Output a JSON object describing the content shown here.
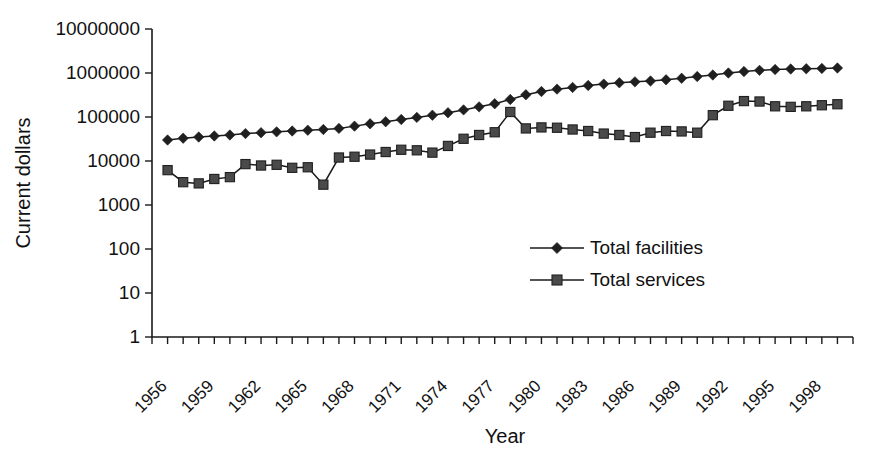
{
  "chart_data": {
    "type": "line",
    "title": "",
    "xlabel": "Year",
    "ylabel": "Current dollars",
    "yscale": "log",
    "ylim": [
      1,
      10000000
    ],
    "ytick_labels": [
      "10000000",
      "1000000",
      "100000",
      "10000",
      "1000",
      "100",
      "10",
      "1"
    ],
    "ytick_values": [
      10000000,
      1000000,
      100000,
      10000,
      1000,
      100,
      10,
      1
    ],
    "xlim": [
      1956,
      2001
    ],
    "xtick_labels": [
      "1956",
      "1959",
      "1962",
      "1965",
      "1968",
      "1971",
      "1974",
      "1977",
      "1980",
      "1983",
      "1986",
      "1989",
      "1992",
      "1995",
      "1998"
    ],
    "xtick_values": [
      1956,
      1959,
      1962,
      1965,
      1968,
      1971,
      1974,
      1977,
      1980,
      1983,
      1986,
      1989,
      1992,
      1995,
      1998
    ],
    "grid": false,
    "legend_position": "inside-center-right",
    "x": [
      1957,
      1958,
      1959,
      1960,
      1961,
      1962,
      1963,
      1964,
      1965,
      1966,
      1967,
      1968,
      1969,
      1970,
      1971,
      1972,
      1973,
      1974,
      1975,
      1976,
      1977,
      1978,
      1979,
      1980,
      1981,
      1982,
      1983,
      1984,
      1985,
      1986,
      1987,
      1988,
      1989,
      1990,
      1991,
      1992,
      1993,
      1994,
      1995,
      1996,
      1997,
      1998,
      1999,
      2000
    ],
    "series": [
      {
        "name": "Total facilities",
        "marker": "diamond",
        "color": "#1f1f1f",
        "values": [
          30000,
          33000,
          35000,
          37000,
          39000,
          42000,
          44000,
          46000,
          48000,
          50000,
          52000,
          55000,
          62000,
          70000,
          78000,
          88000,
          98000,
          110000,
          125000,
          145000,
          170000,
          200000,
          250000,
          320000,
          380000,
          430000,
          470000,
          520000,
          560000,
          600000,
          630000,
          660000,
          700000,
          760000,
          830000,
          900000,
          1000000,
          1080000,
          1150000,
          1200000,
          1230000,
          1250000,
          1270000,
          1300000
        ]
      },
      {
        "name": "Total services",
        "marker": "square",
        "color": "#4a4a4a",
        "values": [
          6200,
          3300,
          3100,
          3900,
          4300,
          8500,
          7900,
          8200,
          7000,
          7200,
          2900,
          12000,
          12500,
          14000,
          16000,
          18000,
          17500,
          15500,
          22000,
          32000,
          39000,
          45000,
          130000,
          55000,
          58000,
          57000,
          52000,
          48000,
          42000,
          39000,
          35000,
          44000,
          48000,
          47000,
          44000,
          110000,
          180000,
          230000,
          225000,
          175000,
          170000,
          175000,
          185000,
          195000
        ]
      }
    ]
  }
}
